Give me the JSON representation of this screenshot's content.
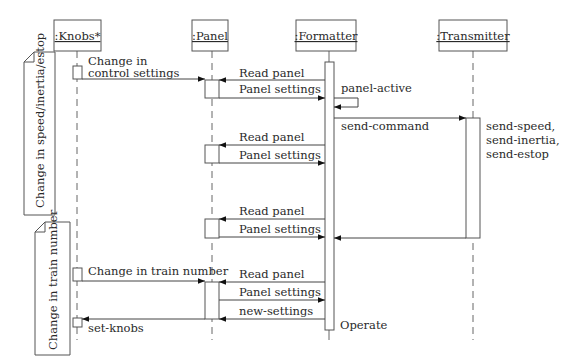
{
  "diagram": {
    "type": "uml-sequence-diagram",
    "objects": [
      {
        "id": "knobs",
        "label": ":Knobs*"
      },
      {
        "id": "panel",
        "label": ":Panel"
      },
      {
        "id": "formatter",
        "label": ":Formatter"
      },
      {
        "id": "transmitter",
        "label": ":Transmitter"
      }
    ],
    "notes": [
      {
        "id": "note-speed",
        "text": "Change in speed/inertia/estop"
      },
      {
        "id": "note-train",
        "text": "Change in train number"
      }
    ],
    "messages": [
      {
        "from": "knobs",
        "to": "panel",
        "label_line1": "Change in",
        "label_line2": "control settings"
      },
      {
        "from": "formatter",
        "to": "panel",
        "label": "Read panel"
      },
      {
        "from": "panel",
        "to": "formatter",
        "label": "Panel settings"
      },
      {
        "from": "formatter",
        "to": "formatter",
        "label": "panel-active"
      },
      {
        "from": "formatter",
        "to": "transmitter",
        "label": "send-command"
      },
      {
        "from": "formatter",
        "to": "panel",
        "label": "Read panel"
      },
      {
        "from": "panel",
        "to": "formatter",
        "label": "Panel settings"
      },
      {
        "from": "formatter",
        "to": "panel",
        "label": "Read panel"
      },
      {
        "from": "panel",
        "to": "formatter",
        "label": "Panel settings"
      },
      {
        "from": "transmitter",
        "to": "formatter",
        "label": ""
      },
      {
        "from": "knobs",
        "to": "panel",
        "label": "Change in train number"
      },
      {
        "from": "formatter",
        "to": "panel",
        "label": "Read panel"
      },
      {
        "from": "panel",
        "to": "formatter",
        "label": "Panel settings"
      },
      {
        "from": "formatter",
        "to": "panel",
        "label": "new-settings"
      },
      {
        "from": "panel",
        "to": "knobs",
        "label": "set-knobs"
      }
    ],
    "annotations": {
      "transmitter_commands": [
        "send-speed,",
        "send-inertia,",
        "send-estop"
      ],
      "formatter_end": "Operate"
    }
  }
}
